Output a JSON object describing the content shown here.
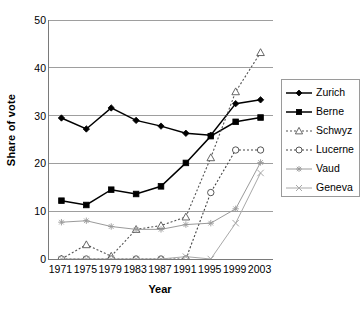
{
  "chart_data": {
    "type": "line",
    "title": "",
    "xlabel": "Year",
    "ylabel": "Share of vote",
    "x": [
      1971,
      1975,
      1979,
      1983,
      1987,
      1991,
      1995,
      1999,
      2003
    ],
    "xtick_labels": [
      "1971",
      "1975",
      "1979",
      "1983",
      "1987",
      "1991",
      "1995",
      "1999",
      "2003"
    ],
    "ytick_labels": [
      "0",
      "10",
      "20",
      "30",
      "40",
      "50"
    ],
    "yticks": [
      0,
      10,
      20,
      30,
      40,
      50
    ],
    "ylim": [
      0,
      50
    ],
    "grid": "horizontal",
    "legend_position": "right",
    "series": [
      {
        "name": "Zurich",
        "marker": "filled-diamond",
        "line": "solid",
        "color": "#000000",
        "values": [
          29.5,
          27.2,
          31.6,
          29.0,
          27.8,
          26.3,
          25.9,
          32.5,
          33.3
        ]
      },
      {
        "name": "Berne",
        "marker": "filled-square",
        "line": "solid",
        "color": "#000000",
        "values": [
          12.2,
          11.3,
          14.5,
          13.6,
          15.2,
          20.1,
          25.7,
          28.7,
          29.6
        ]
      },
      {
        "name": "Schwyz",
        "marker": "open-triangle",
        "line": "dashed",
        "color": "#555555",
        "values": [
          0.0,
          3.0,
          0.6,
          6.2,
          7.0,
          8.8,
          21.2,
          35.0,
          43.2
        ]
      },
      {
        "name": "Lucerne",
        "marker": "open-circle",
        "line": "dashed",
        "color": "#444444",
        "values": [
          0.0,
          0.0,
          0.0,
          0.0,
          0.0,
          0.0,
          13.9,
          22.8,
          22.8
        ]
      },
      {
        "name": "Vaud",
        "marker": "asterisk",
        "line": "solid",
        "color": "#9a9a9a",
        "values": [
          7.7,
          8.0,
          6.8,
          6.2,
          6.2,
          7.2,
          7.5,
          10.5,
          20.2
        ]
      },
      {
        "name": "Geneva",
        "marker": "cross-x",
        "line": "solid",
        "color": "#a8a8a8",
        "values": [
          0.0,
          0.0,
          0.0,
          0.0,
          0.0,
          0.5,
          0.0,
          7.5,
          18.0
        ]
      }
    ]
  }
}
